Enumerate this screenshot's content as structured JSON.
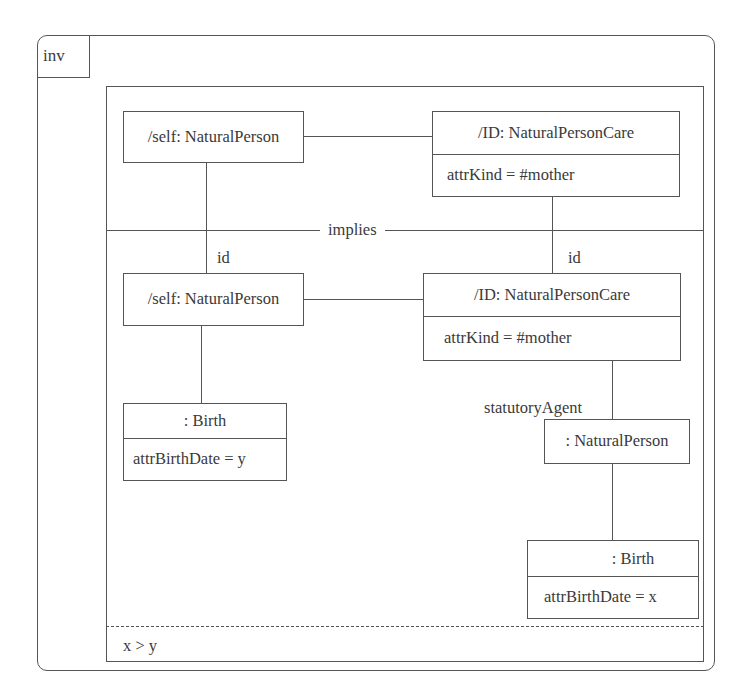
{
  "frame": {
    "tag": "inv"
  },
  "separator": {
    "label": "implies"
  },
  "premise": {
    "self": {
      "title": "/self: NaturalPerson"
    },
    "id": {
      "title": "/ID: NaturalPersonCare",
      "attr": "attrKind = #mother"
    }
  },
  "conclusion": {
    "id_link_left": "id",
    "id_link_right": "id",
    "self": {
      "title": "/self: NaturalPerson"
    },
    "id": {
      "title": "/ID: NaturalPersonCare",
      "attr": "attrKind = #mother"
    },
    "birth_self": {
      "title": ": Birth",
      "attr": "attrBirthDate = y"
    },
    "role_label": "statutoryAgent",
    "agent": {
      "title": ": NaturalPerson"
    },
    "birth_agent": {
      "title": ": Birth",
      "attr": "attrBirthDate = x"
    }
  },
  "constraint": {
    "text": "x > y"
  },
  "colors": {
    "line": "#555555",
    "text": "#3a3a3a",
    "background": "#ffffff"
  }
}
